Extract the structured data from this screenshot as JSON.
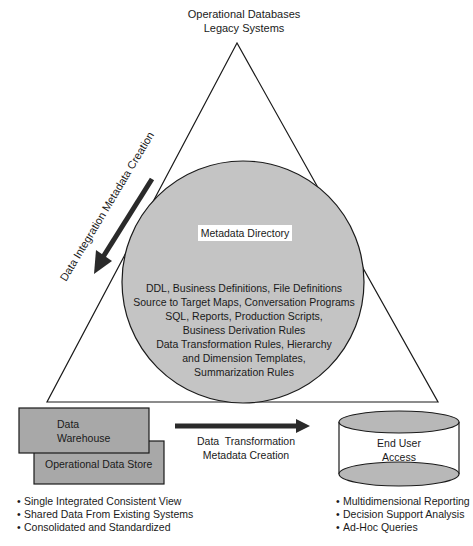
{
  "top_label": [
    "Operational Databases",
    "Legacy Systems"
  ],
  "left_arrow_label": "Data Integration Metadata Creation",
  "circle": {
    "title": "Metadata Directory",
    "lines": [
      "DDL, Business Definitions, File Definitions",
      "Source to Target Maps, Conversation Programs",
      "SQL, Reports, Production Scripts,",
      "Business Derivation Rules",
      "Data Transformation Rules, Hierarchy",
      "and Dimension Templates,",
      "Summarization Rules"
    ]
  },
  "warehouse_box": [
    "Data",
    "Warehouse"
  ],
  "ods_box": "Operational Data Store",
  "bottom_arrow_label": [
    "Data  Transformation",
    "Metadata Creation"
  ],
  "end_user": [
    "End User",
    "Access"
  ],
  "left_bullets": [
    "Single Integrated Consistent View",
    "Shared Data From Existing Systems",
    "Consolidated and Standardized"
  ],
  "right_bullets": [
    "Multidimensional Reporting",
    "Decision Support Analysis",
    "Ad-Hoc Queries"
  ],
  "colors": {
    "fill_gray": "#c4c4c4",
    "box_gray": "#a8a8a8",
    "line": "#1a1a1a"
  }
}
